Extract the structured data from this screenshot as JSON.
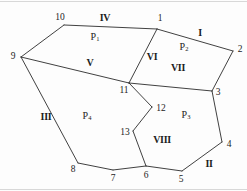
{
  "figure": {
    "type": "planar-subdivision-diagram",
    "width": 247,
    "height": 191,
    "background_color": "#fdfdfd",
    "line_color": "#2b2b2b"
  },
  "vertices": [
    {
      "id": "1",
      "node_x": 157,
      "node_y": 29,
      "label": "1",
      "label_x": 160,
      "label_y": 19
    },
    {
      "id": "2",
      "node_x": 233,
      "node_y": 51,
      "label": "2",
      "label_x": 240,
      "label_y": 50
    },
    {
      "id": "3",
      "node_x": 212,
      "node_y": 91,
      "label": "3",
      "label_x": 218,
      "label_y": 93
    },
    {
      "id": "4",
      "node_x": 222,
      "node_y": 142,
      "label": "4",
      "label_x": 229,
      "label_y": 145
    },
    {
      "id": "5",
      "node_x": 182,
      "node_y": 171,
      "label": "5",
      "label_x": 181,
      "label_y": 180
    },
    {
      "id": "6",
      "node_x": 146,
      "node_y": 166,
      "label": "6",
      "label_x": 146,
      "label_y": 176
    },
    {
      "id": "7",
      "node_x": 113,
      "node_y": 170,
      "label": "7",
      "label_x": 113,
      "label_y": 179
    },
    {
      "id": "8",
      "node_x": 78,
      "node_y": 163,
      "label": "8",
      "label_x": 73,
      "label_y": 170
    },
    {
      "id": "9",
      "node_x": 21,
      "node_y": 57,
      "label": "9",
      "label_x": 13,
      "label_y": 57
    },
    {
      "id": "10",
      "node_x": 64,
      "node_y": 25,
      "label": "10",
      "label_x": 60,
      "label_y": 18
    },
    {
      "id": "11",
      "node_x": 129,
      "node_y": 83,
      "label": "11",
      "label_x": 124,
      "label_y": 91
    },
    {
      "id": "12",
      "node_x": 152,
      "node_y": 107,
      "label": "12",
      "label_x": 161,
      "label_y": 109
    },
    {
      "id": "13",
      "node_x": 133,
      "node_y": 131,
      "label": "13",
      "label_x": 125,
      "label_y": 133
    }
  ],
  "edges": [
    {
      "name": "edge-10-1",
      "from": "10",
      "to": "1"
    },
    {
      "name": "edge-1-2",
      "from": "1",
      "to": "2"
    },
    {
      "name": "edge-2-3",
      "from": "2",
      "to": "3"
    },
    {
      "name": "edge-3-4",
      "from": "3",
      "to": "4"
    },
    {
      "name": "edge-4-5",
      "from": "4",
      "to": "5"
    },
    {
      "name": "edge-5-6",
      "from": "5",
      "to": "6"
    },
    {
      "name": "edge-6-7",
      "from": "6",
      "to": "7"
    },
    {
      "name": "edge-7-8",
      "from": "7",
      "to": "8"
    },
    {
      "name": "edge-8-9",
      "from": "8",
      "to": "9"
    },
    {
      "name": "edge-9-10",
      "from": "9",
      "to": "10"
    },
    {
      "name": "edge-9-11",
      "from": "9",
      "to": "11"
    },
    {
      "name": "edge-11-1",
      "from": "11",
      "to": "1"
    },
    {
      "name": "edge-11-3",
      "from": "11",
      "to": "3"
    },
    {
      "name": "edge-11-12",
      "from": "11",
      "to": "12"
    },
    {
      "name": "edge-12-13",
      "from": "12",
      "to": "13"
    },
    {
      "name": "edge-13-6",
      "from": "13",
      "to": "6"
    }
  ],
  "region_labels": [
    {
      "name": "region-label-I",
      "text": "I",
      "x": 200,
      "y": 33
    },
    {
      "name": "region-label-II",
      "text": "II",
      "x": 209,
      "y": 164
    },
    {
      "name": "region-label-III",
      "text": "III",
      "x": 46,
      "y": 117
    },
    {
      "name": "region-label-IV",
      "text": "IV",
      "x": 105,
      "y": 18
    },
    {
      "name": "region-label-V",
      "text": "V",
      "x": 90,
      "y": 63
    },
    {
      "name": "region-label-VI",
      "text": "VI",
      "x": 152,
      "y": 57
    },
    {
      "name": "region-label-VII",
      "text": "VII",
      "x": 178,
      "y": 68
    },
    {
      "name": "region-label-VIII",
      "text": "VIII",
      "x": 162,
      "y": 140
    }
  ],
  "polygon_labels": [
    {
      "name": "polygon-label-P1",
      "base": "P",
      "sub": "1",
      "x": 95,
      "y": 37
    },
    {
      "name": "polygon-label-P2",
      "base": "P",
      "sub": "2",
      "x": 184,
      "y": 47
    },
    {
      "name": "polygon-label-P3",
      "base": "P",
      "sub": "3",
      "x": 186,
      "y": 115
    },
    {
      "name": "polygon-label-P4",
      "base": "P",
      "sub": "4",
      "x": 87,
      "y": 116
    }
  ]
}
